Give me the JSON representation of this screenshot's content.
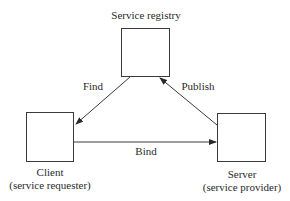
{
  "diagram": {
    "nodes": [
      {
        "id": "registry",
        "label": "Service registry",
        "sublabel": ""
      },
      {
        "id": "client",
        "label": "Client",
        "sublabel": "(service requester)"
      },
      {
        "id": "server",
        "label": "Server",
        "sublabel": "(service provider)"
      }
    ],
    "edges": [
      {
        "from": "registry",
        "to": "client",
        "label": "Find"
      },
      {
        "from": "server",
        "to": "registry",
        "label": "Publish"
      },
      {
        "from": "client",
        "to": "server",
        "label": "Bind"
      }
    ],
    "colors": {
      "line": "#3a3a3a",
      "text": "#2a2a2a",
      "background": "#ffffff"
    }
  }
}
